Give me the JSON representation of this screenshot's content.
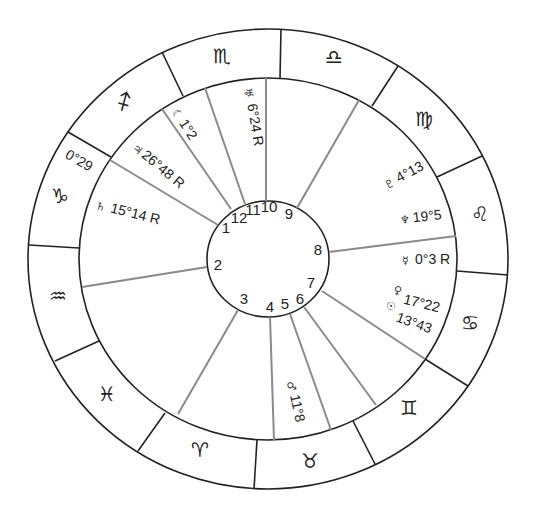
{
  "chart_type": "astrological natal chart wheel",
  "colors": {
    "ring_stroke": "#222222",
    "house_line": "#8a8a8a",
    "background": "#ffffff"
  },
  "zodiac_signs": [
    {
      "name": "scorpio",
      "glyph": "♏"
    },
    {
      "name": "libra",
      "glyph": "♎"
    },
    {
      "name": "virgo",
      "glyph": "♍"
    },
    {
      "name": "leo",
      "glyph": "♌"
    },
    {
      "name": "cancer",
      "glyph": "♋"
    },
    {
      "name": "gemini",
      "glyph": "♊"
    },
    {
      "name": "taurus",
      "glyph": "♉"
    },
    {
      "name": "aries",
      "glyph": "♈"
    },
    {
      "name": "pisces",
      "glyph": "♓"
    },
    {
      "name": "aquarius",
      "glyph": "♒"
    },
    {
      "name": "capricorn",
      "glyph": "♑"
    },
    {
      "name": "sagittarius",
      "glyph": "♐"
    }
  ],
  "cusp_degree_label": "0°29",
  "houses": [
    "1",
    "2",
    "3",
    "4",
    "5",
    "6",
    "7",
    "8",
    "9",
    "10",
    "11",
    "12"
  ],
  "planets": [
    {
      "name": "uranus-retro",
      "glyph": "♅",
      "position": "6°24 R"
    },
    {
      "name": "moon",
      "glyph": "☾",
      "position": "1°2"
    },
    {
      "name": "jupiter",
      "glyph": "♃",
      "position": "26°48 R"
    },
    {
      "name": "saturn",
      "glyph": "♄",
      "position": "15°14  R"
    },
    {
      "name": "pluto",
      "glyph": "♇",
      "position": "4°13"
    },
    {
      "name": "neptune",
      "glyph": "♆",
      "position": "19°5"
    },
    {
      "name": "mercury",
      "glyph": "☿",
      "position": "0°3 R"
    },
    {
      "name": "venus",
      "glyph": "♀",
      "position": "17°22"
    },
    {
      "name": "sun",
      "glyph": "☉",
      "position": "13°43"
    },
    {
      "name": "mars",
      "glyph": "♂",
      "position": "11°8"
    }
  ]
}
